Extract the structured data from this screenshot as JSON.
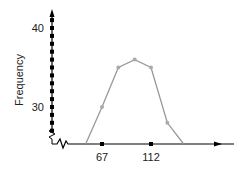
{
  "chart_data": {
    "type": "line",
    "subtype": "frequency-polygon",
    "title": "",
    "xlabel": "",
    "ylabel": "Frequency",
    "x": [
      52,
      67,
      82,
      97,
      112,
      127,
      142
    ],
    "series": [
      {
        "name": "Frequency",
        "values": [
          25.3,
          30,
          35,
          36,
          35,
          28,
          25.3
        ]
      }
    ],
    "x_ticks": [
      67,
      112
    ],
    "x_tick_labels": [
      "67",
      "112"
    ],
    "y_ticks": [
      40,
      30
    ],
    "y_tick_labels": [
      "40",
      "30"
    ],
    "y_minor_dot_step": 1,
    "y_dot_range": [
      27,
      41
    ],
    "xlim": [
      38,
      165
    ],
    "ylim": [
      25.3,
      42
    ],
    "axis_break": {
      "x": true,
      "y": true
    },
    "grid": false,
    "legend": "none",
    "colors": {
      "line": "#999999",
      "marker": "#aaaaaa",
      "axis": "#000000"
    }
  }
}
